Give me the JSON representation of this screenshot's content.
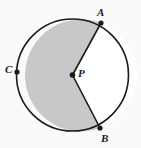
{
  "figure": {
    "type": "geometry-diagram",
    "background_color": "#fafafa",
    "shaded_fill_color": "#c8c8c8",
    "unshaded_fill_color": "#ffffff",
    "stroke_color": "#1a1a1a",
    "point_color": "#1a1a1a",
    "stroke_width": 1.6,
    "circle": {
      "center_x": 72.5,
      "center_y": 75,
      "radius": 56
    },
    "points": [
      {
        "id": "A",
        "label": "A",
        "x": 101,
        "y": 23,
        "angle_deg": -61.3,
        "on": "circle"
      },
      {
        "id": "B",
        "label": "B",
        "x": 100,
        "y": 128,
        "angle_deg": 62.6,
        "on": "circle"
      },
      {
        "id": "C",
        "label": "C",
        "x": 17,
        "y": 72,
        "angle_deg": 183.1,
        "on": "circle"
      },
      {
        "id": "P",
        "label": "P",
        "x": 72.5,
        "y": 75,
        "angle_deg": null,
        "on": "center"
      }
    ],
    "segments": [
      {
        "id": "PA",
        "from": "P",
        "to": "A"
      },
      {
        "id": "PB",
        "from": "P",
        "to": "B"
      }
    ],
    "shaded_sector": {
      "from": "A",
      "to": "B",
      "through": "C",
      "direction": "counterclockwise",
      "is_major": true
    },
    "labels": {
      "A": "A",
      "B": "B",
      "C": "C",
      "P": "P"
    }
  }
}
